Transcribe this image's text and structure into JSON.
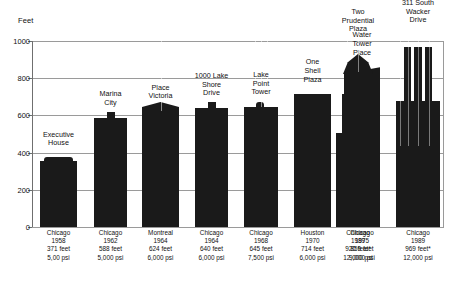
{
  "chart_data": {
    "type": "bar",
    "title": "",
    "ylabel": "Feet",
    "xlabel": "",
    "ylim": [
      0,
      1000
    ],
    "yticks": [
      0,
      200,
      400,
      600,
      800,
      1000
    ],
    "grid": true,
    "legend": false,
    "categories": [
      "Executive House",
      "Marina City",
      "Place Victoria",
      "1000 Lake Shore Drive",
      "Lake Point Tower",
      "One Shell Plaza",
      "Water Tower Place",
      "Two Prudential Plaza",
      "311 South Wacker Drive"
    ],
    "values": [
      371,
      588,
      624,
      640,
      645,
      714,
      859,
      920,
      969
    ],
    "bars": [
      {
        "name": "Executive House",
        "name_lines": [
          "Executive",
          "House"
        ],
        "city": "Chicago",
        "year": "1958",
        "height": "371 feet",
        "strength": "5,00 psi",
        "value": 371,
        "shape": "flat-cap",
        "x": 8,
        "width": 37
      },
      {
        "name": "Marina City",
        "name_lines": [
          "Marina",
          "City"
        ],
        "city": "Chicago",
        "year": "1962",
        "height": "588 feet",
        "strength": "5,000 psi",
        "value": 588,
        "shape": "center-box",
        "x": 62,
        "width": 33
      },
      {
        "name": "Place Victoria",
        "name_lines": [
          "Place",
          "Victoria"
        ],
        "city": "Montreal",
        "year": "1964",
        "height": "624 feet",
        "strength": "6,000 psi",
        "value": 624,
        "shape": "peaked",
        "x": 110,
        "width": 37
      },
      {
        "name": "1000 Lake Shore Drive",
        "name_lines": [
          "1000 Lake",
          "Shore",
          "Drive"
        ],
        "city": "Chicago",
        "year": "1964",
        "height": "640 feet",
        "strength": "6,000 psi",
        "value": 640,
        "shape": "center-box",
        "x": 163,
        "width": 33
      },
      {
        "name": "Lake Point Tower",
        "name_lines": [
          "Lake",
          "Point",
          "Tower"
        ],
        "city": "Chicago",
        "year": "1968",
        "height": "645 feet",
        "strength": "7,500 psi",
        "value": 645,
        "shape": "striped-cap",
        "x": 212,
        "width": 34
      },
      {
        "name": "One Shell Plaza",
        "name_lines": [
          "One",
          "Shell",
          "Plaza"
        ],
        "city": "Houston",
        "year": "1970",
        "height": "714 feet",
        "strength": "6,000 psi",
        "value": 714,
        "shape": "flat",
        "x": 262,
        "width": 37
      },
      {
        "name": "Water Tower Place",
        "name_lines": [
          "Water",
          "Tower",
          "Place"
        ],
        "city": "Chicago",
        "year": "1975",
        "height": "859 feet",
        "strength": "9,000 psi",
        "value": 859,
        "shape": "slanted",
        "x": 312,
        "width": 36
      },
      {
        "name": "Two Prudential Plaza",
        "name_lines": [
          "Two",
          "Prudential",
          "Plaza"
        ],
        "city": "Chicago",
        "year": "1989",
        "height": "920 feet*",
        "strength": "12,000 psi",
        "value": 920,
        "shape": "spire",
        "x": 314,
        "width": 24
      },
      {
        "name": "311 South Wacker Drive",
        "name_lines": [
          "311 South",
          "Wacker",
          "Drive"
        ],
        "city": "Chicago",
        "year": "1989",
        "height": "969 feet*",
        "strength": "12,000 psi",
        "value": 969,
        "shape": "tiered-striped",
        "x": 364,
        "width": 44
      }
    ],
    "colors": {
      "bar": "#1a1a1a",
      "grid": "#9a9a9a",
      "axis": "#6f6f6f",
      "text": "#111111",
      "background": "#ffffff"
    }
  }
}
